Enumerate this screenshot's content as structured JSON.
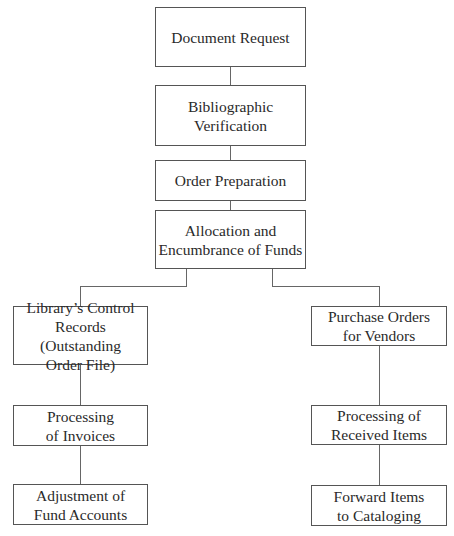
{
  "diagram": {
    "type": "flowchart",
    "nodes": {
      "document_request": "Document Request",
      "bibliographic_verification": "Bibliographic\nVerification",
      "order_preparation": "Order Preparation",
      "allocation": "Allocation and\nEncumbrance of Funds",
      "control_records": "Library’s Control\nRecords (Outstanding\nOrder File)",
      "purchase_orders": "Purchase Orders\nfor Vendors",
      "processing_invoices": "Processing\nof Invoices",
      "processing_received": "Processing of\nReceived Items",
      "adjustment_funds": "Adjustment of\nFund Accounts",
      "forward_items": "Forward Items\nto Cataloging"
    },
    "edges": [
      [
        "document_request",
        "bibliographic_verification"
      ],
      [
        "bibliographic_verification",
        "order_preparation"
      ],
      [
        "order_preparation",
        "allocation"
      ],
      [
        "allocation",
        "control_records"
      ],
      [
        "allocation",
        "purchase_orders"
      ],
      [
        "control_records",
        "processing_invoices"
      ],
      [
        "processing_invoices",
        "adjustment_funds"
      ],
      [
        "purchase_orders",
        "processing_received"
      ],
      [
        "processing_received",
        "forward_items"
      ]
    ]
  }
}
